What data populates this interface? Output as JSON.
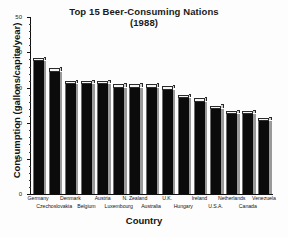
{
  "chart_data": {
    "type": "bar",
    "title": "Top 15 Beer-Consuming Nations",
    "subtitle": "(1988)",
    "xlabel": "Country",
    "ylabel": "Consumption (gallons/capita/year)",
    "ylim": [
      0,
      50
    ],
    "yticks": [
      0,
      10,
      20,
      30,
      40,
      50
    ],
    "ytick_labels": [
      "0",
      "10",
      "20",
      "30",
      "40",
      "50"
    ],
    "grid": false,
    "legend": null,
    "categories": [
      "Germany",
      "Czechoslovakia",
      "Denmark",
      "Belgium",
      "Austria",
      "Luxembourg",
      "N. Zealand",
      "Australia",
      "U.K.",
      "Hungary",
      "Ireland",
      "U.S.A.",
      "Netherlands",
      "Canada",
      "Venezuela"
    ],
    "values": [
      38.5,
      35.5,
      32.0,
      32.0,
      32.0,
      31.0,
      31.0,
      31.0,
      30.5,
      28.0,
      27.0,
      25.0,
      23.5,
      23.5,
      21.5
    ],
    "label_rows": [
      0,
      1,
      0,
      1,
      0,
      1,
      0,
      1,
      0,
      1,
      0,
      1,
      0,
      1,
      0
    ],
    "colors": {
      "bar_face": "#0b0b0b",
      "bar_side": "#9a9a9a",
      "bar_top": "#f4f4f4",
      "axis": "#111111",
      "background": "#fdfdfd",
      "text": "#151515"
    }
  }
}
